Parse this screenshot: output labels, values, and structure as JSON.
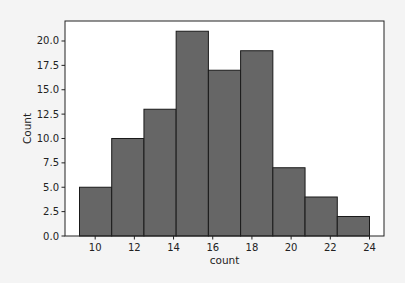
{
  "chart_data": {
    "type": "bar",
    "subtype": "histogram",
    "title": "",
    "xlabel": "count",
    "ylabel": "Count",
    "bin_edges": [
      9.2,
      10.844,
      12.489,
      14.133,
      15.778,
      17.422,
      19.067,
      20.711,
      22.356,
      24.0
    ],
    "values": [
      5,
      10,
      13,
      21,
      17,
      19,
      7,
      4,
      2
    ],
    "xticks": [
      10,
      12,
      14,
      16,
      18,
      20,
      22,
      24
    ],
    "yticks": [
      0.0,
      2.5,
      5.0,
      7.5,
      10.0,
      12.5,
      15.0,
      17.5,
      20.0
    ],
    "ytick_labels": [
      "0.0",
      "2.5",
      "5.0",
      "7.5",
      "10.0",
      "12.5",
      "15.0",
      "17.5",
      "20.0"
    ],
    "xlim": [
      8.46,
      24.74
    ],
    "ylim": [
      0,
      22.05
    ],
    "grid": false,
    "legend": null,
    "bar_color": "#666666",
    "edge_color": "#1a1a1a"
  }
}
